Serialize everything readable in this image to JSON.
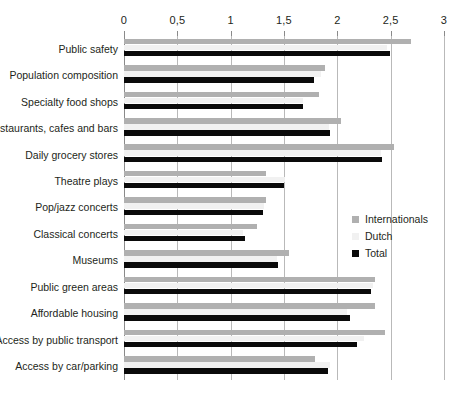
{
  "chart_data": {
    "type": "bar",
    "orientation": "horizontal",
    "title": "",
    "subtitle": "",
    "xlabel": "",
    "ylabel": "",
    "xlim": [
      0,
      3
    ],
    "grid": true,
    "legend_position": "middle-right",
    "tick_labels": [
      "0",
      "0,5",
      "1",
      "1,5",
      "2",
      "2,5",
      "3"
    ],
    "tick_values": [
      0,
      0.5,
      1,
      1.5,
      2,
      2.5,
      3
    ],
    "categories": [
      "Public safety",
      "Population composition",
      "Specialty food shops",
      "Restaurants, cafes and bars",
      "Daily grocery stores",
      "Theatre plays",
      "Pop/jazz concerts",
      "Classical concerts",
      "Museums",
      "Public green areas",
      "Affordable housing",
      "Access by public transport",
      "Access by car/parking"
    ],
    "series": [
      {
        "name": "Internationals",
        "color": "#b0b0b0",
        "values": [
          2.69,
          1.88,
          1.83,
          2.03,
          2.53,
          1.33,
          1.33,
          1.25,
          1.55,
          2.35,
          2.35,
          2.45,
          1.79
        ]
      },
      {
        "name": "Dutch",
        "color": "#f1f1f1",
        "values": [
          2.47,
          1.85,
          1.68,
          1.92,
          2.41,
          1.51,
          1.31,
          1.12,
          1.43,
          2.33,
          2.09,
          2.25,
          1.93
        ]
      },
      {
        "name": "Total",
        "color": "#0a0a0a",
        "values": [
          2.49,
          1.78,
          1.68,
          1.93,
          2.42,
          1.5,
          1.3,
          1.13,
          1.44,
          2.32,
          2.12,
          2.18,
          1.91
        ]
      }
    ]
  }
}
